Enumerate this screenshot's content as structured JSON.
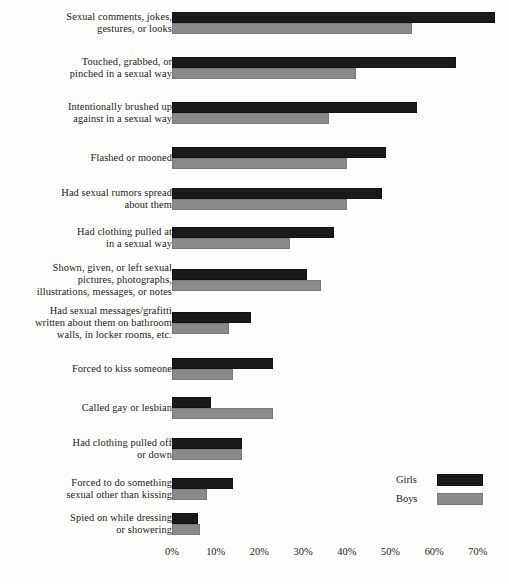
{
  "chart_data": {
    "type": "bar",
    "orientation": "horizontal",
    "title": "",
    "xlabel": "",
    "ylabel": "",
    "xlim": [
      0,
      75
    ],
    "grid": false,
    "legend_position": "bottom-right",
    "tick_labels": [
      "0%",
      "10%",
      "20%",
      "30%",
      "40%",
      "50%",
      "60%",
      "70%"
    ],
    "tick_values": [
      0,
      10,
      20,
      30,
      40,
      50,
      60,
      70
    ],
    "categories": [
      "Sexual comments, jokes, gestures, or looks",
      "Touched, grabbed, or pinched in a sexual way",
      "Intentionally brushed up against in a sexual way",
      "Flashed or mooned",
      "Had sexual rumors spread about them",
      "Had clothing pulled at in a sexual way",
      "Shown, given, or left sexual pictures, photographs, illustrations, messages, or notes",
      "Had sexual messages/grafitti written about them on bathroom walls, in locker rooms, etc.",
      "Forced to kiss someone",
      "Called gay or lesbian",
      "Had clothing pulled off or down",
      "Forced to do something sexual other than kissing",
      "Spied on while dressing or showering"
    ],
    "category_lines": [
      [
        "Sexual comments, jokes,",
        "gestures, or looks"
      ],
      [
        "Touched, grabbed, or",
        "pinched in a sexual way"
      ],
      [
        "Intentionally brushed up",
        "against in a sexual way"
      ],
      [
        "Flashed or mooned"
      ],
      [
        "Had sexual rumors spread",
        "about them"
      ],
      [
        "Had clothing pulled at",
        "in a sexual way"
      ],
      [
        "Shown, given, or left sexual",
        "pictures, photographs,",
        "illustrations, messages, or notes"
      ],
      [
        "Had sexual messages/grafitti",
        "written about them on bathroom",
        "walls, in locker rooms, etc."
      ],
      [
        "Forced to kiss someone"
      ],
      [
        "Called gay or lesbian"
      ],
      [
        "Had clothing pulled off",
        "or down"
      ],
      [
        "Forced to do something",
        "sexual other than kissing"
      ],
      [
        "Spied on while dressing",
        "or showering"
      ]
    ],
    "series": [
      {
        "name": "Girls",
        "color": "#1a1a1a",
        "values": [
          74,
          65,
          56,
          49,
          48,
          37,
          31,
          18,
          23,
          9,
          16,
          14,
          6
        ]
      },
      {
        "name": "Boys",
        "color": "#8a8a8a",
        "values": [
          55,
          42,
          36,
          40,
          40,
          27,
          34,
          13,
          14,
          23,
          16,
          8,
          6.5
        ]
      }
    ]
  },
  "legend": {
    "title": "",
    "entries": [
      {
        "label": "Girls",
        "swatch": "girls-swatch"
      },
      {
        "label": "Boys",
        "swatch": "boys-swatch"
      }
    ]
  },
  "colors": {
    "girls": "#1a1a1a",
    "boys": "#8a8a8a",
    "background": "#fdfdfc",
    "text": "#1b1b1b"
  }
}
